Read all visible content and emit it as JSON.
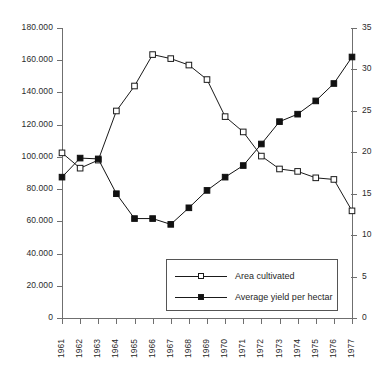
{
  "chart_data": {
    "type": "line",
    "title": "",
    "subtitle": "",
    "xlabel": "",
    "ylabel": "",
    "ylabel_right": "",
    "grid": false,
    "legend_position": "inside-bottom-right",
    "x": [
      1961,
      1962,
      1963,
      1964,
      1965,
      1966,
      1967,
      1968,
      1969,
      1970,
      1971,
      1972,
      1973,
      1974,
      1975,
      1976,
      1977
    ],
    "categories": [
      "1961",
      "1962",
      "1963",
      "1964",
      "1965",
      "1966",
      "1967",
      "1968",
      "1969",
      "1970",
      "1971",
      "1972",
      "1973",
      "1974",
      "1975",
      "1976",
      "1977"
    ],
    "axes": {
      "left": {
        "min": 0,
        "max": 180000,
        "step": 20000,
        "ticks": [
          0,
          20000,
          40000,
          60000,
          80000,
          100000,
          120000,
          140000,
          160000,
          180000
        ],
        "tick_labels": [
          "0",
          "20.000",
          "40.000",
          "60.000",
          "80.000",
          "100.000",
          "120.000",
          "140.000",
          "160.000",
          "180.000"
        ]
      },
      "right": {
        "min": 0,
        "max": 35,
        "step": 5,
        "ticks": [
          0,
          5,
          10,
          15,
          20,
          25,
          30,
          35
        ],
        "tick_labels": [
          "0",
          "5",
          "10",
          "15",
          "20",
          "25",
          "30",
          "35"
        ]
      },
      "x": {
        "min": 1961,
        "max": 1977,
        "tick_labels": [
          "1961",
          "1962",
          "1963",
          "1964",
          "1965",
          "1966",
          "1967",
          "1968",
          "1969",
          "1970",
          "1971",
          "1972",
          "1973",
          "1974",
          "1975",
          "1976",
          "1977"
        ]
      }
    },
    "series": [
      {
        "name": "Area cultivated",
        "axis": "left",
        "marker": "open-square",
        "color": "#1a1a1a",
        "values": [
          102500,
          93000,
          98000,
          128500,
          144000,
          163500,
          161000,
          157000,
          148000,
          125000,
          115500,
          100500,
          92500,
          91000,
          87000,
          86000,
          66500
        ]
      },
      {
        "name": "Average yield per hectar",
        "axis": "right",
        "marker": "filled-square",
        "color": "#111111",
        "values": [
          17.0,
          19.3,
          19.2,
          15.0,
          12.0,
          12.0,
          11.3,
          13.3,
          15.4,
          17.0,
          18.4,
          21.0,
          23.7,
          24.6,
          26.2,
          28.3,
          31.5
        ]
      }
    ]
  },
  "legend": {
    "entries": [
      {
        "label": "Area cultivated",
        "marker": "open-square"
      },
      {
        "label": "Average yield per hectar",
        "marker": "filled-square"
      }
    ]
  },
  "colors": {
    "axis": "#6f6f6f",
    "series_line": "#1a1a1a",
    "text": "#2b2b2b",
    "legend_border": "#555555",
    "background": "#ffffff"
  }
}
